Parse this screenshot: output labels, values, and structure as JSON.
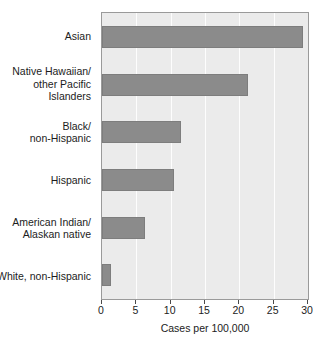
{
  "chart_data": {
    "type": "bar",
    "orientation": "horizontal",
    "title": "",
    "xlabel": "Cases per 100,000",
    "ylabel": "",
    "categories": [
      "Asian",
      "Native Hawaiian/\nother Pacific\nIslanders",
      "Black/\nnon-Hispanic",
      "Hispanic",
      "American Indian/\nAlaskan native",
      "White, non-Hispanic"
    ],
    "values": [
      29.3,
      21.2,
      11.5,
      10.5,
      6.2,
      1.3
    ],
    "xlim": [
      0,
      30
    ],
    "xticks": [
      0,
      5,
      10,
      15,
      20,
      25,
      30
    ],
    "xtick_labels": [
      "0",
      "5",
      "10",
      "15",
      "20",
      "25",
      "30"
    ],
    "grid": "vertical-white",
    "legend": "none",
    "colors": {
      "bar_fill": "#8b8b8b",
      "bar_edge": "#7d7d7d",
      "plot_background": "#ebebeb",
      "gridline": "#fdfdfd",
      "plot_border": "#9a9a9a",
      "text": "#1c1c1c",
      "figure_background": "#ffffff"
    }
  },
  "category_lines": [
    [
      "Asian"
    ],
    [
      "Native Hawaiian/",
      "other Pacific",
      "Islanders"
    ],
    [
      "Black/",
      "non-Hispanic"
    ],
    [
      "Hispanic"
    ],
    [
      "American Indian/",
      "Alaskan native"
    ],
    [
      "White, non-Hispanic"
    ]
  ]
}
